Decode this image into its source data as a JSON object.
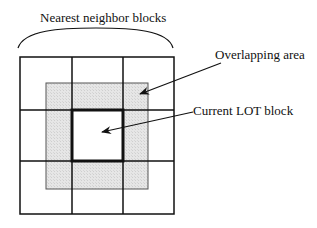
{
  "diagram": {
    "title": "Nearest neighbor blocks",
    "labels": {
      "overlapping_area": "Overlapping area",
      "current_block": "Current LOT block"
    },
    "grid": {
      "rows": 3,
      "cols": 3,
      "center_cell": "Current LOT block",
      "surrounding_cells": "Nearest neighbor blocks"
    },
    "colors": {
      "line": "#111111",
      "overlap_fill": "#e3e3e3",
      "background": "#ffffff"
    }
  }
}
